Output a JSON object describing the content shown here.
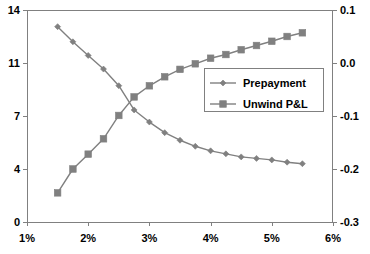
{
  "chart_data": {
    "type": "line",
    "title": "",
    "xlabel": "",
    "ylabel": "",
    "y2label": "",
    "grid": false,
    "legend_position": "center-right",
    "xlim": [
      1,
      6
    ],
    "xticks": [
      "1%",
      "2%",
      "3%",
      "4%",
      "5%",
      "6%"
    ],
    "xtick_values": [
      1,
      2,
      3,
      4,
      5,
      6
    ],
    "ylim": [
      0,
      14
    ],
    "yticks": [
      "0",
      "4",
      "7",
      "11",
      "14"
    ],
    "ytick_values": [
      0,
      3.5,
      7,
      10.5,
      14
    ],
    "y2lim": [
      -0.3,
      0.1
    ],
    "y2ticks": [
      "-0.3",
      "-0.2",
      "-0.1",
      "0.0",
      "0.1"
    ],
    "y2tick_values": [
      -0.3,
      -0.2,
      -0.1,
      0.0,
      0.1
    ],
    "x": [
      1.5,
      1.75,
      2.0,
      2.25,
      2.5,
      2.75,
      3.0,
      3.25,
      3.5,
      3.75,
      4.0,
      4.25,
      4.5,
      4.75,
      5.0,
      5.25,
      5.5
    ],
    "series": [
      {
        "name": "Prepayment",
        "axis": "left",
        "marker": "diamond",
        "color": "#808080",
        "values": [
          12.9,
          11.9,
          11.0,
          10.1,
          9.0,
          7.4,
          6.6,
          5.9,
          5.4,
          5.0,
          4.7,
          4.5,
          4.3,
          4.2,
          4.1,
          3.95,
          3.85
        ]
      },
      {
        "name": "Unwind P&L",
        "axis": "right",
        "marker": "square",
        "color": "#808080",
        "values": [
          -0.245,
          -0.2,
          -0.172,
          -0.143,
          -0.099,
          -0.064,
          -0.043,
          -0.026,
          -0.012,
          -0.0015,
          0.009,
          0.016,
          0.025,
          0.033,
          0.041,
          0.05,
          0.057
        ]
      }
    ]
  },
  "legend": {
    "entries": [
      {
        "label": "Prepayment"
      },
      {
        "label": "Unwind P&L"
      }
    ]
  }
}
